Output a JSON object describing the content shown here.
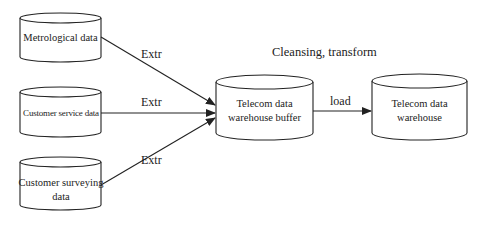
{
  "diagram": {
    "type": "data-flow",
    "nodes": [
      {
        "id": "metrological",
        "label": "Metrological data",
        "shape": "cylinder"
      },
      {
        "id": "customer_service",
        "label": "Customer service data",
        "shape": "cylinder"
      },
      {
        "id": "customer_surveying",
        "label": "Customer surveying data",
        "shape": "cylinder"
      },
      {
        "id": "buffer",
        "label": "Telecom data warehouse buffer",
        "shape": "cylinder"
      },
      {
        "id": "warehouse",
        "label": "Telecom data warehouse",
        "shape": "cylinder"
      }
    ],
    "edges": [
      {
        "from": "metrological",
        "to": "buffer",
        "label": "Extr"
      },
      {
        "from": "customer_service",
        "to": "buffer",
        "label": "Extr"
      },
      {
        "from": "customer_surveying",
        "to": "buffer",
        "label": "Extr"
      },
      {
        "from": "buffer",
        "to": "warehouse",
        "label": "load"
      }
    ],
    "stage_label": "Cleansing, transform"
  },
  "labels": {
    "node1": "Metrological data",
    "node2": "Customer service data",
    "node3_line1": "Customer surveying",
    "node3_line2": "data",
    "buffer_line1": "Telecom data",
    "buffer_line2": "warehouse buffer",
    "warehouse_line1": "Telecom data",
    "warehouse_line2": "warehouse",
    "edge1": "Extr",
    "edge2": "Extr",
    "edge3": "Extr",
    "edge4": "load",
    "stage": "Cleansing, transform"
  }
}
